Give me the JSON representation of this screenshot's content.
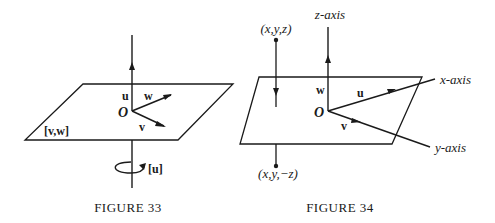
{
  "figure33": {
    "caption": "FIGURE 33",
    "labels": {
      "u": "u",
      "w": "w",
      "v": "v",
      "origin": "O",
      "plane": "[v,w]",
      "rotation": "[u]"
    }
  },
  "figure34": {
    "caption": "FIGURE 34",
    "labels": {
      "z_axis": "z-axis",
      "x_axis": "x-axis",
      "y_axis": "y-axis",
      "u": "u",
      "w": "w",
      "v": "v",
      "origin": "O",
      "point_above": "(x,y,z)",
      "point_below": "(x,y,−z)"
    }
  }
}
